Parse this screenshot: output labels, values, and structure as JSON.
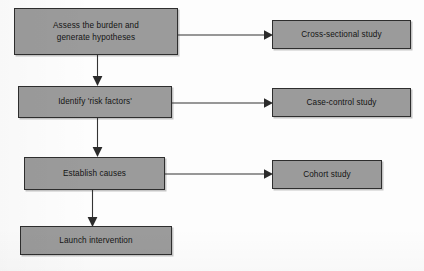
{
  "diagram": {
    "colors": {
      "box_fill": "#9b9b9b",
      "box_border": "#2e2e2e",
      "text": "#141414",
      "arrow": "#333333",
      "background": "#fdfdfd"
    },
    "nodes": [
      {
        "id": "assess-burden",
        "label": "Assess the burden and\ngenerate hypotheses",
        "column": "left",
        "row": 1
      },
      {
        "id": "cross-sectional-study",
        "label": "Cross-sectional study",
        "column": "right",
        "row": 1
      },
      {
        "id": "identify-risk-factors",
        "label": "Identify 'risk factors'",
        "column": "left",
        "row": 2
      },
      {
        "id": "case-control-study",
        "label": "Case-control study",
        "column": "right",
        "row": 2
      },
      {
        "id": "establish-causes",
        "label": "Establish causes",
        "column": "left",
        "row": 3
      },
      {
        "id": "cohort-study",
        "label": "Cohort study",
        "column": "right",
        "row": 3
      },
      {
        "id": "launch-intervention",
        "label": "Launch intervention",
        "column": "left",
        "row": 4
      }
    ],
    "connectors": [
      {
        "id": "assess-to-cross-sectional",
        "from": "assess-burden",
        "to": "cross-sectional-study",
        "direction": "right"
      },
      {
        "id": "assess-to-identify",
        "from": "assess-burden",
        "to": "identify-risk-factors",
        "direction": "down"
      },
      {
        "id": "identify-to-case-control",
        "from": "identify-risk-factors",
        "to": "case-control-study",
        "direction": "right"
      },
      {
        "id": "identify-to-establish",
        "from": "identify-risk-factors",
        "to": "establish-causes",
        "direction": "down"
      },
      {
        "id": "establish-to-cohort",
        "from": "establish-causes",
        "to": "cohort-study",
        "direction": "right"
      },
      {
        "id": "establish-to-launch",
        "from": "establish-causes",
        "to": "launch-intervention",
        "direction": "down"
      }
    ]
  }
}
